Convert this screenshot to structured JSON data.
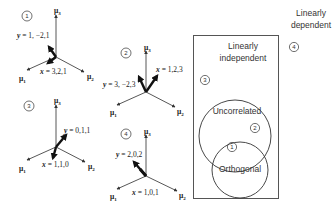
{
  "diagrams": [
    {
      "id": "1",
      "label": "1",
      "axes": {
        "mu1": "μ",
        "mu1_sub": "1",
        "mu2": "μ",
        "mu2_sub": "2",
        "mu3": "μ",
        "mu3_sub": "3"
      },
      "y_var": "y",
      "y_value": " = 1, −2,1",
      "x_var": "x",
      "x_value": " = 3,2,1"
    },
    {
      "id": "2",
      "label": "2",
      "axes": {
        "mu1": "μ",
        "mu1_sub": "1",
        "mu2": "μ",
        "mu2_sub": "2",
        "mu3": "μ",
        "mu3_sub": "3"
      },
      "y_var": "y",
      "y_value": " = 3, −2,3",
      "x_var": "x",
      "x_value": " = 1,2,3"
    },
    {
      "id": "3",
      "label": "3",
      "axes": {
        "mu1": "μ",
        "mu1_sub": "1",
        "mu2": "μ",
        "mu2_sub": "2",
        "mu3": "μ",
        "mu3_sub": "3"
      },
      "y_var": "y",
      "y_value": " = 0,1,1",
      "x_var": "x",
      "x_value": " = 1,1,0"
    },
    {
      "id": "4",
      "label": "4",
      "axes": {
        "mu1": "μ",
        "mu1_sub": "1",
        "mu2": "μ",
        "mu2_sub": "2",
        "mu3": "μ",
        "mu3_sub": "3"
      },
      "y_var": "y",
      "y_value": " = 2,0,2",
      "x_var": "x",
      "x_value": " = 1,0,1"
    }
  ],
  "venn": {
    "outer_label_line1": "Linearly",
    "outer_label_line2": "dependent",
    "outer_marker": "4",
    "box_label_line1": "Linearly",
    "box_label_line2": "independent",
    "box_marker": "3",
    "circle_top_label": "Uncorrelated",
    "circle_top_marker": "2",
    "circle_bottom_label": "Orthogonal",
    "intersection_marker": "1"
  },
  "colors": {
    "line": "#333333",
    "vector": "#111111",
    "box": "#555555",
    "background": "#ffffff"
  }
}
